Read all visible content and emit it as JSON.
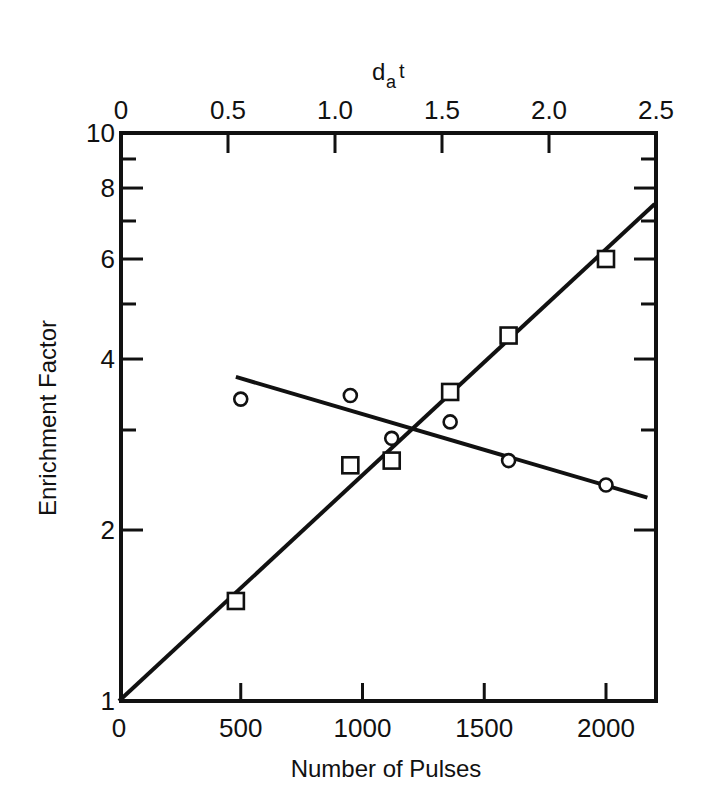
{
  "chart_data": {
    "type": "scatter",
    "title": "",
    "xlabel": "Number of Pulses",
    "ylabel": "Enrichment Factor",
    "x2label_main": "d",
    "x2label_sub": "a",
    "x2label_tail": "t",
    "yscale": "log",
    "xlim": [
      0,
      2200
    ],
    "ylim": [
      1,
      10
    ],
    "x2lim": [
      0,
      2.5
    ],
    "grid": false,
    "legend": null,
    "x_ticks": [
      {
        "value": 0,
        "label": "0"
      },
      {
        "value": 500,
        "label": "500"
      },
      {
        "value": 1000,
        "label": "1000"
      },
      {
        "value": 1500,
        "label": "1500"
      },
      {
        "value": 2000,
        "label": "2000"
      }
    ],
    "x2_ticks": [
      {
        "value": 0,
        "label": "0"
      },
      {
        "value": 0.5,
        "label": "0.5"
      },
      {
        "value": 1.0,
        "label": "1.0"
      },
      {
        "value": 1.5,
        "label": "1.5"
      },
      {
        "value": 2.0,
        "label": "2.0"
      },
      {
        "value": 2.5,
        "label": "2.5"
      }
    ],
    "y_ticks": [
      {
        "value": 1,
        "label": "1"
      },
      {
        "value": 2,
        "label": "2"
      },
      {
        "value": 3,
        "label": ""
      },
      {
        "value": 4,
        "label": "4"
      },
      {
        "value": 5,
        "label": ""
      },
      {
        "value": 6,
        "label": "6"
      },
      {
        "value": 7,
        "label": ""
      },
      {
        "value": 8,
        "label": "8"
      },
      {
        "value": 9,
        "label": ""
      },
      {
        "value": 10,
        "label": "10"
      }
    ],
    "series": [
      {
        "name": "squares",
        "marker": "square",
        "x": [
          480,
          950,
          1120,
          1360,
          1600,
          2000
        ],
        "y": [
          1.5,
          2.6,
          2.65,
          3.5,
          4.4,
          6.0
        ],
        "fit_line": {
          "x": [
            0,
            2200
          ],
          "y": [
            1.0,
            7.5
          ]
        }
      },
      {
        "name": "circles",
        "marker": "circle",
        "x": [
          500,
          950,
          1120,
          1360,
          1600,
          2000
        ],
        "y": [
          3.4,
          3.45,
          2.9,
          3.1,
          2.65,
          2.4
        ],
        "fit_line": {
          "x": [
            480,
            2170
          ],
          "y": [
            3.72,
            2.28
          ]
        }
      }
    ]
  }
}
